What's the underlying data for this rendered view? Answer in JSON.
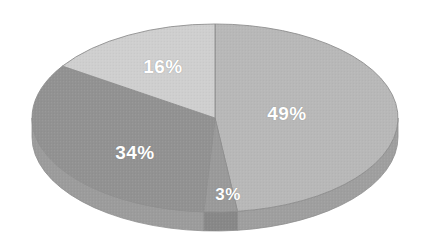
{
  "chart_data": {
    "type": "pie",
    "title": "",
    "subtitle": "",
    "xlabel": "",
    "ylabel": "",
    "legend": "none",
    "grid": false,
    "three_d": true,
    "unit": "%",
    "categories": [
      "Segment 1",
      "Segment 2",
      "Segment 3",
      "Segment 4"
    ],
    "values": [
      49,
      3,
      34,
      16
    ],
    "labels": [
      "49%",
      "3%",
      "34%",
      "16%"
    ],
    "colors": [
      "#b8b8b8",
      "#9a9a9a",
      "#929292",
      "#cfcfcf"
    ],
    "side_colors": [
      "#9f9f9f",
      "#888888",
      "#9c9c9c",
      "#bdbdbd"
    ],
    "slices": [
      {
        "label": "49%",
        "value": 49,
        "color": "#b8b8b8",
        "side_color": "#9f9f9f",
        "label_x": 287,
        "label_y": 113
      },
      {
        "label": "3%",
        "value": 3,
        "color": "#9a9a9a",
        "side_color": "#888888",
        "label_x": 228,
        "label_y": 194
      },
      {
        "label": "34%",
        "value": 34,
        "color": "#929292",
        "side_color": "#9c9c9c",
        "label_x": 135,
        "label_y": 152
      },
      {
        "label": "16%",
        "value": 16,
        "color": "#cfcfcf",
        "side_color": "#bdbdbd",
        "label_x": 163,
        "label_y": 66
      }
    ],
    "geometry": {
      "center_x": 215,
      "center_y": 118,
      "radius_x": 183,
      "radius_y": 94,
      "depth": 19,
      "start_angle_deg": -90,
      "direction": "clockwise"
    },
    "background": "#ffffff",
    "label_color": "#ffffff",
    "outline_color": "#8e8e8e"
  }
}
